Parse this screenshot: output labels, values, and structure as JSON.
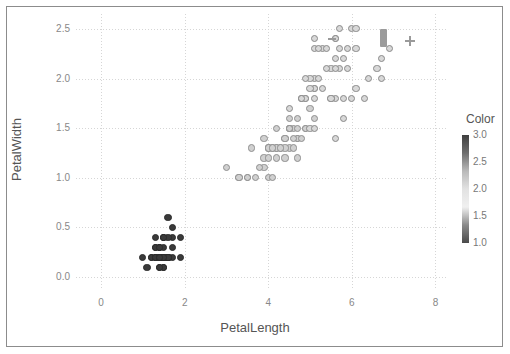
{
  "figure": {
    "background_color": "#ffffff",
    "frame_color": "#8c8c8c",
    "grid_color": "#d6d6d6"
  },
  "axes": {
    "x": {
      "label": "PetalLength",
      "ticks": [
        "0",
        "2",
        "4",
        "6",
        "8"
      ],
      "tick_values": [
        0,
        2,
        4,
        6,
        8
      ],
      "range": [
        -0.6,
        8.3
      ]
    },
    "y": {
      "label": "PetalWidth",
      "ticks": [
        "0.0",
        "0.5",
        "1.0",
        "1.5",
        "2.0",
        "2.5"
      ],
      "tick_values": [
        0.0,
        0.5,
        1.0,
        1.5,
        2.0,
        2.5
      ],
      "range": [
        -0.13,
        2.65
      ]
    }
  },
  "legend": {
    "title": "Color",
    "ticks": [
      "3.0",
      "2.5",
      "2.0",
      "1.5",
      "1.0"
    ],
    "tick_values": [
      3.0,
      2.5,
      2.0,
      1.5,
      1.0
    ],
    "gradient_stops": [
      "#3f3f3f",
      "#6e6e6e",
      "#b9b9b9",
      "#e2e2e2",
      "#f0f0f0",
      "#8a8a8a",
      "#4a4a4a"
    ]
  },
  "overlay": {
    "bar_marker": {
      "name": "bar-annotation",
      "color": "#9b9b9b",
      "x": 6.76,
      "y": 2.41
    },
    "plus_marker": {
      "name": "plus-annotation",
      "color": "#9a9a9a",
      "x": 7.4,
      "y": 2.38
    },
    "dash_marker": {
      "name": "dash-annotation",
      "color": "#9a9a9a",
      "x": 5.52,
      "y": 2.4
    }
  },
  "chart_data": {
    "type": "scatter",
    "title": "",
    "xlabel": "PetalLength",
    "ylabel": "PetalWidth",
    "xlim": [
      -0.6,
      8.3
    ],
    "ylim": [
      -0.13,
      2.65
    ],
    "grid": true,
    "legend_position": "right",
    "colorbar_label": "Color",
    "colorbar_range": [
      1.0,
      3.0
    ],
    "series": [
      {
        "name": "Species 1",
        "color_value": 1.0,
        "marker_fill": "#3a3a3a",
        "marker_edge": "#2b2b2b",
        "points": [
          [
            1.4,
            0.2
          ],
          [
            1.4,
            0.2
          ],
          [
            1.3,
            0.2
          ],
          [
            1.5,
            0.2
          ],
          [
            1.4,
            0.2
          ],
          [
            1.7,
            0.4
          ],
          [
            1.4,
            0.3
          ],
          [
            1.5,
            0.2
          ],
          [
            1.4,
            0.2
          ],
          [
            1.5,
            0.1
          ],
          [
            1.5,
            0.2
          ],
          [
            1.6,
            0.2
          ],
          [
            1.4,
            0.1
          ],
          [
            1.1,
            0.1
          ],
          [
            1.2,
            0.2
          ],
          [
            1.5,
            0.4
          ],
          [
            1.3,
            0.4
          ],
          [
            1.4,
            0.3
          ],
          [
            1.7,
            0.3
          ],
          [
            1.5,
            0.3
          ],
          [
            1.7,
            0.2
          ],
          [
            1.5,
            0.4
          ],
          [
            1.0,
            0.2
          ],
          [
            1.7,
            0.5
          ],
          [
            1.9,
            0.2
          ],
          [
            1.6,
            0.2
          ],
          [
            1.6,
            0.4
          ],
          [
            1.5,
            0.2
          ],
          [
            1.4,
            0.2
          ],
          [
            1.6,
            0.2
          ],
          [
            1.6,
            0.2
          ],
          [
            1.5,
            0.4
          ],
          [
            1.5,
            0.1
          ],
          [
            1.4,
            0.2
          ],
          [
            1.5,
            0.2
          ],
          [
            1.2,
            0.2
          ],
          [
            1.3,
            0.2
          ],
          [
            1.4,
            0.1
          ],
          [
            1.3,
            0.2
          ],
          [
            1.5,
            0.2
          ],
          [
            1.3,
            0.3
          ],
          [
            1.3,
            0.3
          ],
          [
            1.3,
            0.2
          ],
          [
            1.6,
            0.6
          ],
          [
            1.9,
            0.4
          ],
          [
            1.4,
            0.3
          ],
          [
            1.6,
            0.2
          ],
          [
            1.4,
            0.2
          ],
          [
            1.5,
            0.2
          ],
          [
            1.4,
            0.2
          ]
        ]
      },
      {
        "name": "Species 2",
        "color_value": 2.0,
        "marker_fill": "#d0d0d0",
        "marker_edge": "#8f8f8f",
        "points": [
          [
            4.7,
            1.4
          ],
          [
            4.5,
            1.5
          ],
          [
            4.9,
            1.5
          ],
          [
            4.0,
            1.3
          ],
          [
            4.6,
            1.5
          ],
          [
            4.5,
            1.3
          ],
          [
            4.7,
            1.6
          ],
          [
            3.3,
            1.0
          ],
          [
            4.6,
            1.3
          ],
          [
            3.9,
            1.4
          ],
          [
            3.5,
            1.0
          ],
          [
            4.2,
            1.5
          ],
          [
            4.0,
            1.0
          ],
          [
            4.7,
            1.4
          ],
          [
            3.6,
            1.3
          ],
          [
            4.4,
            1.4
          ],
          [
            4.5,
            1.5
          ],
          [
            4.1,
            1.0
          ],
          [
            4.5,
            1.5
          ],
          [
            3.9,
            1.1
          ],
          [
            4.8,
            1.8
          ],
          [
            4.0,
            1.3
          ],
          [
            4.9,
            1.5
          ],
          [
            4.7,
            1.2
          ],
          [
            4.3,
            1.3
          ],
          [
            4.4,
            1.4
          ],
          [
            4.8,
            1.4
          ],
          [
            5.0,
            1.7
          ],
          [
            4.5,
            1.5
          ],
          [
            3.5,
            1.0
          ],
          [
            3.8,
            1.1
          ],
          [
            3.7,
            1.0
          ],
          [
            3.9,
            1.2
          ],
          [
            5.1,
            1.6
          ],
          [
            4.5,
            1.5
          ],
          [
            4.5,
            1.6
          ],
          [
            4.7,
            1.5
          ],
          [
            4.4,
            1.3
          ],
          [
            4.1,
            1.3
          ],
          [
            4.0,
            1.3
          ],
          [
            4.4,
            1.2
          ],
          [
            4.6,
            1.4
          ],
          [
            4.0,
            1.2
          ],
          [
            3.3,
            1.0
          ],
          [
            4.2,
            1.3
          ],
          [
            4.2,
            1.2
          ],
          [
            4.2,
            1.3
          ],
          [
            4.3,
            1.3
          ],
          [
            3.0,
            1.1
          ],
          [
            4.1,
            1.3
          ]
        ]
      },
      {
        "name": "Species 3",
        "color_value": 3.0,
        "marker_fill": "#d8d8d8",
        "marker_edge": "#8a8a8a",
        "points": [
          [
            6.0,
            2.5
          ],
          [
            5.1,
            1.9
          ],
          [
            5.9,
            2.1
          ],
          [
            5.6,
            1.8
          ],
          [
            5.8,
            2.2
          ],
          [
            6.6,
            2.1
          ],
          [
            4.5,
            1.7
          ],
          [
            6.3,
            1.8
          ],
          [
            5.8,
            1.8
          ],
          [
            6.1,
            2.5
          ],
          [
            5.1,
            2.0
          ],
          [
            5.3,
            1.9
          ],
          [
            5.5,
            2.1
          ],
          [
            5.0,
            2.0
          ],
          [
            5.1,
            2.4
          ],
          [
            5.3,
            2.3
          ],
          [
            5.5,
            1.8
          ],
          [
            6.7,
            2.2
          ],
          [
            6.9,
            2.3
          ],
          [
            5.0,
            1.5
          ],
          [
            5.7,
            2.3
          ],
          [
            4.9,
            2.0
          ],
          [
            6.7,
            2.0
          ],
          [
            4.9,
            1.8
          ],
          [
            5.7,
            2.1
          ],
          [
            6.0,
            1.8
          ],
          [
            4.8,
            1.8
          ],
          [
            4.9,
            1.8
          ],
          [
            5.6,
            2.1
          ],
          [
            5.8,
            1.6
          ],
          [
            6.1,
            1.9
          ],
          [
            6.4,
            2.0
          ],
          [
            5.6,
            2.2
          ],
          [
            5.1,
            1.5
          ],
          [
            5.6,
            1.4
          ],
          [
            6.1,
            2.3
          ],
          [
            5.6,
            2.4
          ],
          [
            5.5,
            1.8
          ],
          [
            4.8,
            1.8
          ],
          [
            5.4,
            2.1
          ],
          [
            5.6,
            2.4
          ],
          [
            5.1,
            2.3
          ],
          [
            5.1,
            1.9
          ],
          [
            5.9,
            2.3
          ],
          [
            5.7,
            2.5
          ],
          [
            5.2,
            2.3
          ],
          [
            5.0,
            1.9
          ],
          [
            5.2,
            2.0
          ],
          [
            5.4,
            2.3
          ],
          [
            5.1,
            1.8
          ]
        ]
      }
    ]
  }
}
